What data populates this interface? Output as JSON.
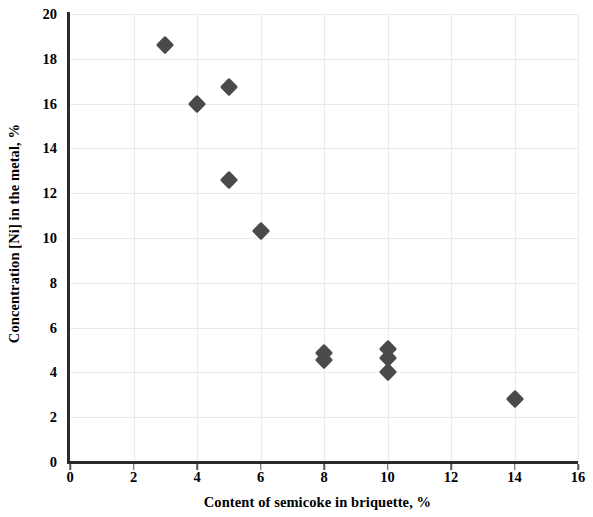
{
  "chart_data": {
    "type": "scatter",
    "title": "",
    "xlabel": "Content of semicoke in briquette, %",
    "ylabel": "Concentration [Ni] in the metal, %",
    "xlim": [
      0,
      16
    ],
    "ylim": [
      0,
      20
    ],
    "xticks": [
      0,
      2,
      4,
      6,
      8,
      10,
      12,
      14,
      16
    ],
    "yticks": [
      0,
      2,
      4,
      6,
      8,
      10,
      12,
      14,
      16,
      18,
      20
    ],
    "grid": true,
    "legend": null,
    "marker": "diamond",
    "marker_color": "#4a4a4a",
    "series": [
      {
        "name": "Concentration [Ni] in the metal",
        "points": [
          {
            "x": 3,
            "y": 18.6
          },
          {
            "x": 4,
            "y": 16.0
          },
          {
            "x": 5,
            "y": 16.75
          },
          {
            "x": 5,
            "y": 12.6
          },
          {
            "x": 6,
            "y": 10.3
          },
          {
            "x": 8,
            "y": 4.85
          },
          {
            "x": 8,
            "y": 4.55
          },
          {
            "x": 10,
            "y": 5.05
          },
          {
            "x": 10,
            "y": 4.65
          },
          {
            "x": 10,
            "y": 4.0
          },
          {
            "x": 14,
            "y": 2.8
          }
        ]
      }
    ]
  },
  "axis": {
    "x_tick_labels": [
      "0",
      "2",
      "4",
      "6",
      "8",
      "10",
      "12",
      "14",
      "16"
    ],
    "y_tick_labels": [
      "0",
      "2",
      "4",
      "6",
      "8",
      "10",
      "12",
      "14",
      "16",
      "18",
      "20"
    ],
    "x_title": "Content of semicoke in briquette, %",
    "y_title": "Concentration [Ni] in the metal, %"
  },
  "style": {
    "axis_color": "#2b2b2b",
    "grid_color": "#e9e9ef",
    "marker_color": "#4a4a4a",
    "background": "#ffffff"
  }
}
